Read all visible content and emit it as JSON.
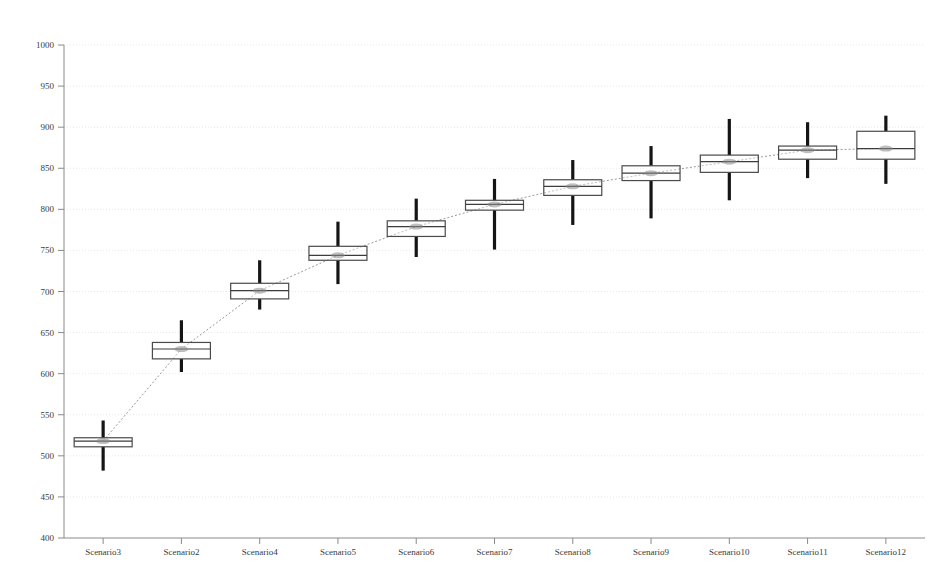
{
  "chart_data": {
    "type": "box",
    "title": "",
    "xlabel": "",
    "ylabel": "",
    "ylim": [
      400,
      1000
    ],
    "ytick_step": 50,
    "yticks": [
      400,
      450,
      500,
      550,
      600,
      650,
      700,
      750,
      800,
      850,
      900,
      950,
      1000
    ],
    "ytick_labels": [
      "400",
      "450",
      "500",
      "550",
      "600",
      "650",
      "700",
      "750",
      "800",
      "850",
      "900",
      "950",
      "1000"
    ],
    "grid": true,
    "grid_axis": "y",
    "legend": "none",
    "categories": [
      "Scenario3",
      "Scenario2",
      "Scenario4",
      "Scenario5",
      "Scenario6",
      "Scenario7",
      "Scenario8",
      "Scenario9",
      "Scenario10",
      "Scenario11",
      "Scenario12"
    ],
    "boxes": [
      {
        "category": "Scenario3",
        "whisker_low": 482,
        "q1": 511,
        "median": 518,
        "q3": 522,
        "whisker_high": 543
      },
      {
        "category": "Scenario2",
        "whisker_low": 602,
        "q1": 618,
        "median": 630,
        "q3": 638,
        "whisker_high": 665
      },
      {
        "category": "Scenario4",
        "whisker_low": 678,
        "q1": 691,
        "median": 701,
        "q3": 710,
        "whisker_high": 738
      },
      {
        "category": "Scenario5",
        "whisker_low": 709,
        "q1": 738,
        "median": 744,
        "q3": 755,
        "whisker_high": 785
      },
      {
        "category": "Scenario6",
        "whisker_low": 742,
        "q1": 767,
        "median": 779,
        "q3": 786,
        "whisker_high": 813
      },
      {
        "category": "Scenario7",
        "whisker_low": 751,
        "q1": 799,
        "median": 806,
        "q3": 811,
        "whisker_high": 837
      },
      {
        "category": "Scenario8",
        "whisker_low": 781,
        "q1": 817,
        "median": 828,
        "q3": 836,
        "whisker_high": 860
      },
      {
        "category": "Scenario9",
        "whisker_low": 789,
        "q1": 835,
        "median": 844,
        "q3": 853,
        "whisker_high": 877
      },
      {
        "category": "Scenario10",
        "whisker_low": 811,
        "q1": 845,
        "median": 858,
        "q3": 866,
        "whisker_high": 910
      },
      {
        "category": "Scenario11",
        "whisker_low": 838,
        "q1": 861,
        "median": 872,
        "q3": 877,
        "whisker_high": 906
      },
      {
        "category": "Scenario12",
        "whisker_low": 831,
        "q1": 861,
        "median": 874,
        "q3": 895,
        "whisker_high": 914
      }
    ],
    "connector_series": {
      "name": "median-trend",
      "values": [
        518,
        630,
        701,
        744,
        779,
        806,
        828,
        844,
        858,
        872,
        874
      ]
    },
    "colors": {
      "box_stroke": "#4a4a4a",
      "whisker": "#151515",
      "gridline": "#e8e8e8",
      "axis": "#8a8a8a",
      "connector": "#9a9a9a",
      "text": "#3a3a3a",
      "background": "#ffffff"
    }
  }
}
